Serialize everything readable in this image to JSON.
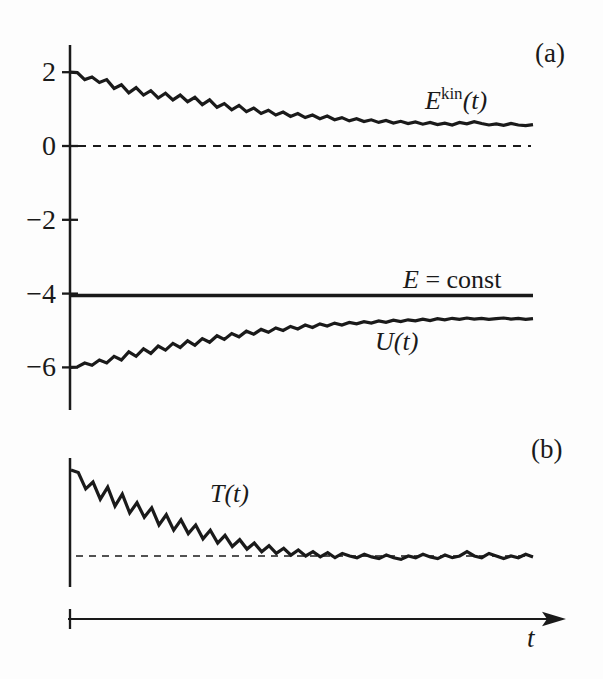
{
  "figure": {
    "ink_color": "#1a1a1a",
    "background": "#fdfdfd",
    "panel_a_tag": "(a)",
    "panel_b_tag": "(b)",
    "x_axis_label": "t"
  },
  "panel_a": {
    "y_ticks": [
      "2",
      "0",
      "−2",
      "−4",
      "−6"
    ],
    "labels": {
      "ekin_base": "E",
      "ekin_sup": "kin",
      "ekin_arg": "(t)",
      "e_const_var": "E",
      "e_const_rest": " = const",
      "u_label": "U(t)"
    }
  },
  "panel_b": {
    "t_label": "T(t)"
  },
  "chart_data": [
    {
      "type": "line",
      "panel": "a",
      "title": "",
      "xlabel": "t",
      "ylabel": "",
      "ylim": [
        -7,
        2.8
      ],
      "yticks": [
        2,
        0,
        -2,
        -4,
        -6
      ],
      "grid": false,
      "dashed_level": 0,
      "series": [
        {
          "name": "E^kin(t)",
          "values": [
            2.0,
            1.99,
            1.8,
            1.87,
            1.72,
            1.8,
            1.56,
            1.66,
            1.44,
            1.58,
            1.38,
            1.5,
            1.3,
            1.43,
            1.25,
            1.38,
            1.2,
            1.32,
            1.12,
            1.25,
            1.05,
            1.15,
            0.98,
            1.1,
            0.93,
            1.03,
            0.88,
            0.97,
            0.84,
            0.92,
            0.8,
            0.88,
            0.77,
            0.84,
            0.74,
            0.81,
            0.71,
            0.77,
            0.68,
            0.74,
            0.66,
            0.71,
            0.64,
            0.69,
            0.62,
            0.67,
            0.61,
            0.65,
            0.59,
            0.64,
            0.58,
            0.62,
            0.57,
            0.64,
            0.6,
            0.66,
            0.61,
            0.57,
            0.6,
            0.56,
            0.61,
            0.57,
            0.55,
            0.58
          ]
        },
        {
          "name": "E = const",
          "constant": -4.05
        },
        {
          "name": "U(t)",
          "values": [
            -6.0,
            -5.99,
            -5.88,
            -5.94,
            -5.8,
            -5.88,
            -5.7,
            -5.8,
            -5.58,
            -5.7,
            -5.5,
            -5.62,
            -5.42,
            -5.53,
            -5.35,
            -5.46,
            -5.28,
            -5.4,
            -5.22,
            -5.32,
            -5.14,
            -5.24,
            -5.08,
            -5.17,
            -5.02,
            -5.1,
            -4.97,
            -5.05,
            -4.93,
            -5.0,
            -4.89,
            -4.96,
            -4.85,
            -4.92,
            -4.82,
            -4.88,
            -4.8,
            -4.85,
            -4.78,
            -4.82,
            -4.76,
            -4.8,
            -4.74,
            -4.78,
            -4.72,
            -4.76,
            -4.71,
            -4.74,
            -4.69,
            -4.73,
            -4.68,
            -4.71,
            -4.67,
            -4.7,
            -4.66,
            -4.69,
            -4.67,
            -4.7,
            -4.68,
            -4.66,
            -4.69,
            -4.67,
            -4.7,
            -4.68
          ]
        }
      ]
    },
    {
      "type": "line",
      "panel": "b",
      "title": "",
      "xlabel": "t",
      "ylabel": "",
      "dashed_level": 1.0,
      "series": [
        {
          "name": "T(t)",
          "values": [
            2.0,
            1.97,
            1.78,
            1.86,
            1.66,
            1.8,
            1.58,
            1.72,
            1.5,
            1.62,
            1.45,
            1.56,
            1.36,
            1.48,
            1.3,
            1.42,
            1.26,
            1.36,
            1.2,
            1.3,
            1.15,
            1.24,
            1.11,
            1.19,
            1.08,
            1.15,
            1.05,
            1.12,
            1.03,
            1.09,
            1.01,
            1.07,
            1.0,
            1.05,
            0.99,
            1.04,
            0.98,
            1.03,
            1.0,
            0.98,
            1.02,
            0.99,
            0.97,
            1.01,
            0.98,
            0.96,
            1.0,
            0.98,
            1.02,
            0.99,
            0.97,
            1.01,
            0.98,
            1.0,
            1.05,
            1.0,
            0.98,
            1.03,
            1.0,
            0.97,
            1.0,
            0.98,
            1.02,
            0.99
          ]
        }
      ]
    }
  ]
}
